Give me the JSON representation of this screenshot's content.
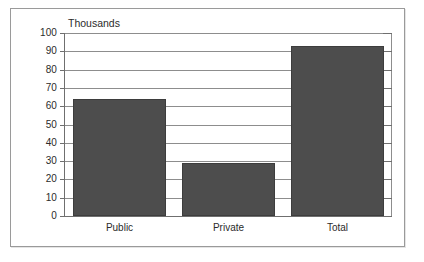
{
  "chart_data": {
    "type": "bar",
    "title": "Thousands",
    "xlabel": "",
    "ylabel": "",
    "categories": [
      "Public",
      "Private",
      "Total"
    ],
    "values": [
      64,
      29,
      93
    ],
    "series": [
      {
        "name": "Count",
        "values": [
          64,
          29,
          93
        ]
      }
    ],
    "ylim": [
      0,
      100
    ],
    "ytick_labels": [
      "0",
      "10",
      "20",
      "30",
      "40",
      "50",
      "60",
      "70",
      "80",
      "90",
      "100"
    ],
    "ytick_values": [
      0,
      10,
      20,
      30,
      40,
      50,
      60,
      70,
      80,
      90,
      100
    ],
    "grid": true,
    "grid_axis": "y",
    "legend": false,
    "legend_position": "none",
    "bar_color": "#4d4d4d",
    "axis_color": "#6f6f6f",
    "grid_color": "#8d8d8d",
    "background": "#ffffff",
    "frame_border_color": "#9a9a9a"
  }
}
